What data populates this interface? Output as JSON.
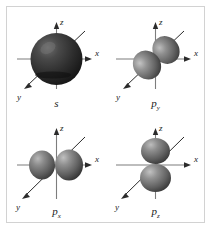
{
  "figure": {
    "name": "atomic-orbital-shapes-figure",
    "border_color": "#d2d2d2",
    "background_color": "#ffffff"
  },
  "axis_labels": {
    "x": "x",
    "y": "y",
    "z": "z"
  },
  "panels": [
    {
      "id": "s",
      "label": "s",
      "label_base": "s",
      "label_sub": "",
      "orbital_type": "sphere",
      "orientation": "isotropic",
      "fill_color": "#2e2e2e",
      "highlight_color": "#6e6e6e"
    },
    {
      "id": "py",
      "label": "py",
      "label_base": "p",
      "label_sub": "y",
      "orbital_type": "dumbbell",
      "orientation": "y-axis",
      "fill_color": "#6b6b6b",
      "highlight_color": "#b5b5b5"
    },
    {
      "id": "px",
      "label": "px",
      "label_base": "p",
      "label_sub": "x",
      "orbital_type": "dumbbell",
      "orientation": "x-axis",
      "fill_color": "#6b6b6b",
      "highlight_color": "#b5b5b5"
    },
    {
      "id": "pz",
      "label": "pz",
      "label_base": "p",
      "label_sub": "z",
      "orbital_type": "dumbbell",
      "orientation": "z-axis",
      "fill_color": "#6b6b6b",
      "highlight_color": "#b5b5b5"
    }
  ]
}
